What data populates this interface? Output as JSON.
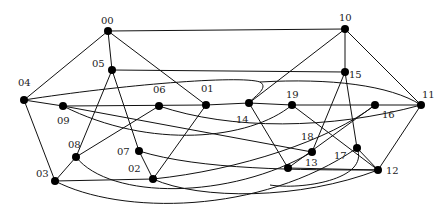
{
  "diagram": {
    "type": "graph",
    "nodes": [
      {
        "id": "00",
        "x": 108,
        "y": 31,
        "lx": 101,
        "ly": 24
      },
      {
        "id": "10",
        "x": 345,
        "y": 29,
        "lx": 339,
        "ly": 21
      },
      {
        "id": "05",
        "x": 112,
        "y": 70,
        "lx": 92,
        "ly": 67
      },
      {
        "id": "15",
        "x": 345,
        "y": 72,
        "lx": 349,
        "ly": 78
      },
      {
        "id": "04",
        "x": 24,
        "y": 100,
        "lx": 18,
        "ly": 86
      },
      {
        "id": "09",
        "x": 63,
        "y": 106,
        "lx": 57,
        "ly": 124
      },
      {
        "id": "06",
        "x": 159,
        "y": 106,
        "lx": 153,
        "ly": 93
      },
      {
        "id": "01",
        "x": 206,
        "y": 105,
        "lx": 201,
        "ly": 92
      },
      {
        "id": "14",
        "x": 249,
        "y": 103,
        "lx": 236,
        "ly": 123
      },
      {
        "id": "19",
        "x": 292,
        "y": 105,
        "lx": 286,
        "ly": 98
      },
      {
        "id": "16",
        "x": 375,
        "y": 105,
        "lx": 382,
        "ly": 118
      },
      {
        "id": "11",
        "x": 421,
        "y": 105,
        "lx": 422,
        "ly": 98
      },
      {
        "id": "08",
        "x": 76,
        "y": 157,
        "lx": 68,
        "ly": 148
      },
      {
        "id": "07",
        "x": 139,
        "y": 151,
        "lx": 117,
        "ly": 155
      },
      {
        "id": "02",
        "x": 153,
        "y": 179,
        "lx": 128,
        "ly": 172
      },
      {
        "id": "03",
        "x": 55,
        "y": 181,
        "lx": 36,
        "ly": 177
      },
      {
        "id": "18",
        "x": 312,
        "y": 152,
        "lx": 301,
        "ly": 140
      },
      {
        "id": "13",
        "x": 288,
        "y": 168,
        "lx": 305,
        "ly": 166
      },
      {
        "id": "17",
        "x": 357,
        "y": 148,
        "lx": 334,
        "ly": 159
      },
      {
        "id": "12",
        "x": 378,
        "y": 170,
        "lx": 386,
        "ly": 174
      }
    ],
    "edges": [
      {
        "d": "M108,31 L345,29"
      },
      {
        "d": "M108,31 L24,100"
      },
      {
        "d": "M108,31 L112,70"
      },
      {
        "d": "M108,31 L206,105"
      },
      {
        "d": "M345,29 L345,72"
      },
      {
        "d": "M345,29 L249,103"
      },
      {
        "d": "M345,29 L421,105"
      },
      {
        "d": "M112,70 L345,72"
      },
      {
        "d": "M112,70 L76,157"
      },
      {
        "d": "M112,70 L139,151"
      },
      {
        "d": "M24,100 C120,85 240,75 260,82 C270,88 252,98 249,103"
      },
      {
        "d": "M24,100 L63,106"
      },
      {
        "d": "M24,100 L55,181"
      },
      {
        "d": "M63,106 L206,105"
      },
      {
        "d": "M63,106 C150,150 250,140 292,105"
      },
      {
        "d": "M63,106 L312,152"
      },
      {
        "d": "M159,106 L76,157"
      },
      {
        "d": "M159,106 C230,130 330,130 421,105"
      },
      {
        "d": "M206,105 L153,179"
      },
      {
        "d": "M206,105 L249,103"
      },
      {
        "d": "M249,103 L292,105"
      },
      {
        "d": "M249,103 L288,168"
      },
      {
        "d": "M292,105 L421,105"
      },
      {
        "d": "M292,105 L378,170"
      },
      {
        "d": "M345,72 L312,152"
      },
      {
        "d": "M345,72 L357,148"
      },
      {
        "d": "M260,82 C330,78 390,85 421,105"
      },
      {
        "d": "M421,105 L378,170"
      },
      {
        "d": "M375,105 L288,168"
      },
      {
        "d": "M375,105 C330,140 240,170 153,179"
      },
      {
        "d": "M76,157 L55,181"
      },
      {
        "d": "M76,157 C110,200 230,200 312,152"
      },
      {
        "d": "M139,151 L153,179"
      },
      {
        "d": "M139,151 C200,170 300,170 378,170"
      },
      {
        "d": "M55,181 L153,179"
      },
      {
        "d": "M55,181 C120,215 260,215 357,148"
      },
      {
        "d": "M153,179 C200,200 300,200 378,170"
      },
      {
        "d": "M288,168 L378,170"
      },
      {
        "d": "M357,148 L378,170"
      },
      {
        "d": "M357,148 C370,180 300,190 270,185"
      }
    ]
  }
}
